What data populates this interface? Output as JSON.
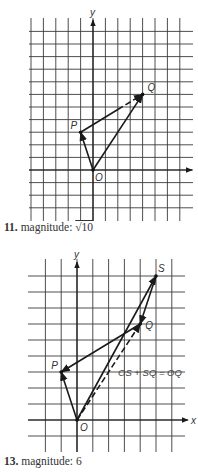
{
  "figures": [
    {
      "axis_labels": {
        "y": "y",
        "x": ""
      },
      "points": [
        {
          "name": "O",
          "x": 0,
          "y": 0
        },
        {
          "name": "P",
          "x": -1,
          "y": 3
        },
        {
          "name": "Q",
          "x": 4,
          "y": 6
        }
      ],
      "vectors": [
        {
          "from": "O",
          "to": "P",
          "style": "solid"
        },
        {
          "from": "O",
          "to": "Q",
          "style": "solid"
        },
        {
          "from": "P",
          "to": "Q",
          "style": "solid-dashed"
        }
      ],
      "caption": {
        "number": "11.",
        "text": "magnitude:",
        "value": "√10"
      }
    },
    {
      "axis_labels": {
        "y": "y",
        "x": "x"
      },
      "points": [
        {
          "name": "O",
          "x": 0,
          "y": 0
        },
        {
          "name": "P",
          "x": -1,
          "y": 3
        },
        {
          "name": "Q",
          "x": 4,
          "y": 6
        },
        {
          "name": "S",
          "x": 5,
          "y": 9
        }
      ],
      "vectors": [
        {
          "from": "O",
          "to": "P",
          "style": "solid"
        },
        {
          "from": "Q",
          "to": "P",
          "style": "solid"
        },
        {
          "from": "O",
          "to": "S",
          "style": "solid"
        },
        {
          "from": "S",
          "to": "Q",
          "style": "solid"
        },
        {
          "from": "O",
          "to": "Q",
          "style": "dashed"
        }
      ],
      "equation": "OS + SQ = OQ",
      "caption": {
        "number": "13.",
        "text": "magnitude:",
        "value": "6"
      }
    }
  ]
}
